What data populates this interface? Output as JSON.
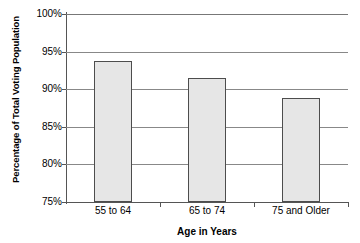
{
  "chart_data": {
    "type": "bar",
    "title": "",
    "subtitle": "",
    "categories": [
      "55 to 64",
      "65 to 74",
      "75 and Older"
    ],
    "values": [
      93.8,
      91.5,
      88.8
    ],
    "xlabel": "Age in Years",
    "ylabel": "Percentage of Total Voting Population",
    "ylim": [
      75,
      100
    ],
    "yticks": [
      75,
      80,
      85,
      90,
      95,
      100
    ],
    "ytick_labels": [
      "75%",
      "80%",
      "85%",
      "90%",
      "95%",
      "100%"
    ],
    "grid": true,
    "grid_axis": "y",
    "legend": false,
    "legend_position": "none",
    "annotations": [],
    "colors": {
      "bar_fill": "#e6e6e6",
      "bar_border": "#4d4d4d",
      "gridline": "#888888",
      "axis": "#555555",
      "text": "#000000",
      "background": "#ffffff"
    }
  }
}
